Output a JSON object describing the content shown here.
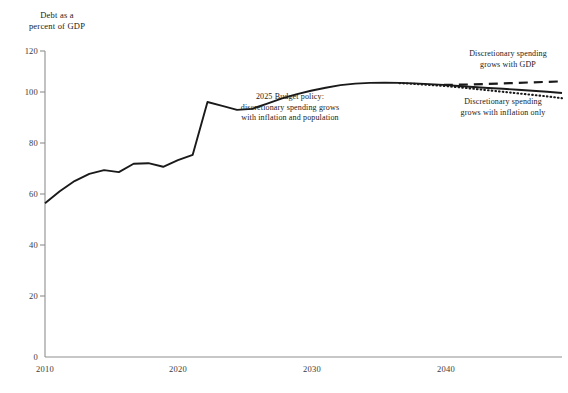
{
  "chart_data": {
    "type": "line",
    "title": "",
    "ylabel": "Debt as a\npercent of GDP",
    "xlabel": "",
    "xlim": [
      2010,
      2045
    ],
    "ylim": [
      0,
      120
    ],
    "yticks": [
      0,
      20,
      40,
      60,
      80,
      100,
      120
    ],
    "xticks": [
      2010,
      2020,
      2030,
      2040
    ],
    "xtick_labels": [
      "2010",
      "2020",
      "2030",
      "2040"
    ],
    "ytick_labels": [
      "0",
      "20",
      "40",
      "60",
      "80",
      "100",
      "120"
    ],
    "grid": false,
    "legend_position": "inline-annotations",
    "series": [
      {
        "name": "2025 Budget policy: discretionary spending grows with inflation and population",
        "style": "solid",
        "color": "#1a1a1a",
        "x": [
          2010,
          2011,
          2012,
          2013,
          2014,
          2015,
          2016,
          2017,
          2018,
          2019,
          2020,
          2021,
          2022,
          2023,
          2024,
          2025,
          2026,
          2027,
          2028,
          2029,
          2030,
          2031,
          2032,
          2033,
          2034,
          2035,
          2036,
          2037,
          2038,
          2039,
          2040,
          2041,
          2042,
          2043,
          2044,
          2045
        ],
        "values": [
          60.3,
          65.0,
          69.0,
          71.8,
          73.3,
          72.5,
          75.8,
          76.0,
          74.6,
          77.2,
          79.3,
          100.0,
          98.5,
          96.9,
          97.3,
          99.3,
          101.3,
          103.0,
          104.4,
          105.6,
          106.6,
          107.2,
          107.5,
          107.6,
          107.5,
          107.3,
          107.0,
          106.7,
          106.3,
          105.9,
          105.5,
          105.2,
          104.8,
          104.4,
          104.0,
          103.5
        ]
      },
      {
        "name": "Discretionary spending grows with GDP",
        "style": "dashed",
        "color": "#1a1a1a",
        "x": [
          2037,
          2038,
          2039,
          2040,
          2041,
          2042,
          2043,
          2044,
          2045
        ],
        "values": [
          106.7,
          106.8,
          106.9,
          107.1,
          107.3,
          107.5,
          107.7,
          107.9,
          108.1
        ]
      },
      {
        "name": "Discretionary spending grows with inflation only",
        "style": "dotted",
        "color": "#1a1a1a",
        "x": [
          2034,
          2035,
          2036,
          2037,
          2038,
          2039,
          2040,
          2041,
          2042,
          2043,
          2044,
          2045
        ],
        "values": [
          107.4,
          107.1,
          106.7,
          106.3,
          105.8,
          105.2,
          104.6,
          104.0,
          103.4,
          102.8,
          102.2,
          101.5
        ]
      }
    ],
    "annotations": [
      {
        "id": "budget-policy-note",
        "text": "2025 Budget policy:\ndiscretionary spending grows\nwith inflation and population",
        "x_px": 290,
        "y_px": 92
      },
      {
        "id": "gdp-growth-note",
        "text": "Discretionary spending\ngrows with GDP",
        "x_px": 508,
        "y_px": 49
      },
      {
        "id": "inflation-only-note",
        "text": "Discretionary spending\ngrows with inflation only",
        "x_px": 503,
        "y_px": 97
      }
    ]
  }
}
